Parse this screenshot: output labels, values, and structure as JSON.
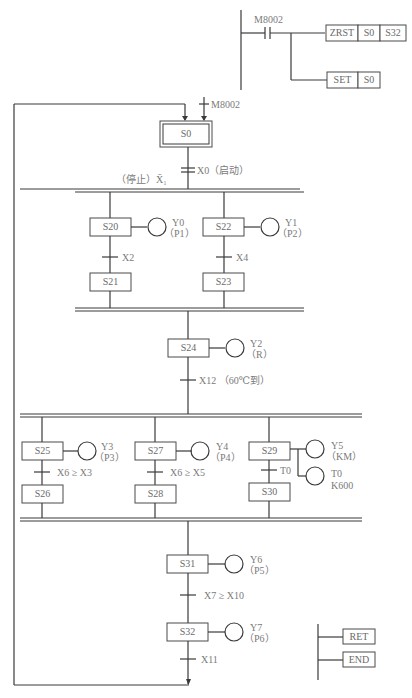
{
  "ladder_init": {
    "contact": "M8002",
    "instructions": [
      {
        "op": "ZRST",
        "args": [
          "S0",
          "S32"
        ]
      },
      {
        "op": "SET",
        "args": [
          "S0"
        ]
      }
    ]
  },
  "initial": {
    "step": "S0",
    "trigger": "M8002",
    "transition": "X0（启动）",
    "stop_label": "（停止）X̄₁"
  },
  "branch1": {
    "left": {
      "step1": "S20",
      "out": "Y0",
      "out_sub": "（P1）",
      "trans": "X2",
      "step2": "S21"
    },
    "right": {
      "step1": "S22",
      "out": "Y1",
      "out_sub": "（P2）",
      "trans": "X4",
      "step2": "S23"
    }
  },
  "mid": {
    "step": "S24",
    "out": "Y2",
    "out_sub": "（R）",
    "trans": "X12 （60℃到）"
  },
  "branch2": {
    "a": {
      "step1": "S25",
      "out": "Y3",
      "out_sub": "（P3）",
      "trans": "X6 ≥ X3",
      "step2": "S26"
    },
    "b": {
      "step1": "S27",
      "out": "Y4",
      "out_sub": "（P4）",
      "trans": "X6 ≥ X5",
      "step2": "S28"
    },
    "c": {
      "step1": "S29",
      "out": "Y5",
      "out_sub": "（KM）",
      "out2": "T0",
      "out2_sub": "K600",
      "trans": "T0",
      "step2": "S30"
    }
  },
  "tail": {
    "s31": {
      "step": "S31",
      "out": "Y6",
      "out_sub": "（P5）",
      "trans": "X7 ≥ X10"
    },
    "s32": {
      "step": "S32",
      "out": "Y7",
      "out_sub": "（P6）",
      "trans": "X11"
    }
  },
  "end_ladder": {
    "ret": "RET",
    "end": "END"
  }
}
